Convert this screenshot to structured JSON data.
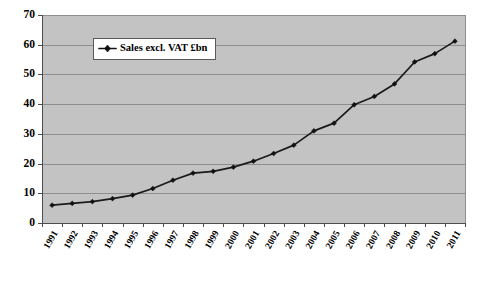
{
  "chart_data": {
    "type": "line",
    "title": "",
    "xlabel": "",
    "ylabel": "",
    "ylim": [
      0,
      70
    ],
    "ytick_step": 10,
    "grid": true,
    "legend_position": "inside-top-left",
    "plot_background": "#c3c3c3",
    "series_color": "#111111",
    "categories": [
      "1991",
      "1992",
      "1993",
      "1994",
      "1995",
      "1996",
      "1997",
      "1998",
      "1999",
      "2000",
      "2001",
      "2002",
      "2003",
      "2004",
      "2005",
      "2006",
      "2007",
      "2008",
      "2009",
      "2010",
      "2011"
    ],
    "series": [
      {
        "name": "Sales excl. VAT £bn",
        "values": [
          6.0,
          6.6,
          7.2,
          8.2,
          9.4,
          11.6,
          14.4,
          16.8,
          17.4,
          18.8,
          20.8,
          23.4,
          26.2,
          31.0,
          33.6,
          39.8,
          42.6,
          46.8,
          54.2,
          57.0,
          61.2
        ]
      }
    ],
    "ytick_labels": [
      "0",
      "10",
      "20",
      "30",
      "40",
      "50",
      "60",
      "70"
    ],
    "legend_entries": [
      "Sales excl. VAT £bn"
    ]
  },
  "figure": {
    "bottom_rule_present": true
  }
}
